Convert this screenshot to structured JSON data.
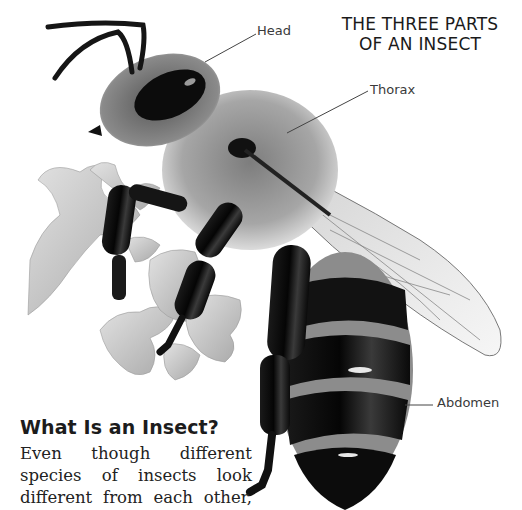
{
  "page": {
    "title_lines": [
      "THE THREE PARTS",
      "OF AN INSECT"
    ],
    "labels": {
      "head": "Head",
      "thorax": "Thorax",
      "abdomen": "Abdomen"
    },
    "section": {
      "heading": "What Is an Insect?",
      "body_lines": [
        "Even though different",
        "species of insects look",
        "different from each other,"
      ]
    },
    "illustration": {
      "subject": "honeybee-on-flower",
      "colors": {
        "ink": "#0e0e0e",
        "fur": "#9a9a9a",
        "flower": "#c9c9c9",
        "wing": "#e4e4e4",
        "leader_line": "#444444"
      }
    }
  }
}
